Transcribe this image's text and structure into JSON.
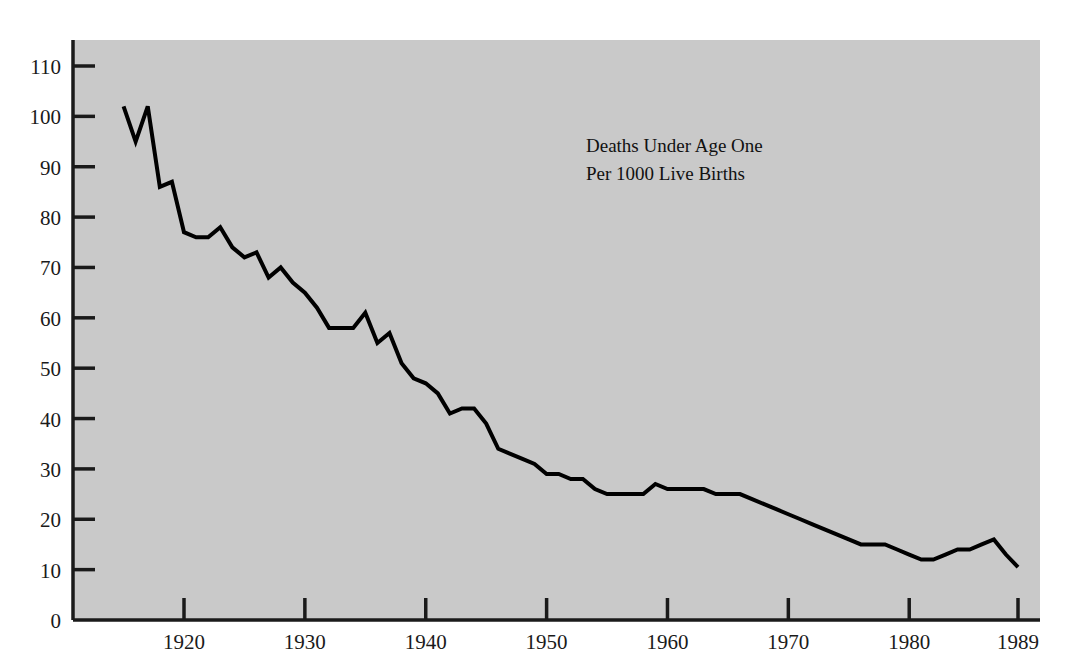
{
  "chart_data": {
    "type": "line",
    "title": "",
    "annotation": [
      "Deaths Under Age One",
      "Per 1000 Live Births"
    ],
    "xlabel": "",
    "ylabel": "",
    "xlim": [
      1915,
      1989
    ],
    "ylim": [
      0,
      115
    ],
    "grid": false,
    "legend": "none",
    "plot_background": "#c9c9c9",
    "line_color": "#000000",
    "axis_color": "#1a1a1a",
    "y_ticks": [
      0,
      10,
      20,
      30,
      40,
      50,
      60,
      70,
      80,
      90,
      100,
      110
    ],
    "y_tick_labels": [
      "0",
      "10",
      "20",
      "30",
      "40",
      "50",
      "60",
      "70",
      "80",
      "90",
      "100",
      "110"
    ],
    "x_ticks": [
      1920,
      1930,
      1940,
      1950,
      1960,
      1970,
      1980,
      1989
    ],
    "x_tick_labels": [
      "1920",
      "1930",
      "1940",
      "1950",
      "1960",
      "1970",
      "1980",
      "1989"
    ],
    "series": [
      {
        "name": "Infant mortality rate",
        "x": [
          1915,
          1916,
          1917,
          1918,
          1919,
          1920,
          1921,
          1922,
          1923,
          1924,
          1925,
          1926,
          1927,
          1928,
          1929,
          1930,
          1931,
          1932,
          1933,
          1934,
          1935,
          1936,
          1937,
          1938,
          1939,
          1940,
          1941,
          1942,
          1943,
          1944,
          1945,
          1946,
          1947,
          1948,
          1949,
          1950,
          1951,
          1952,
          1953,
          1954,
          1955,
          1956,
          1957,
          1958,
          1959,
          1960,
          1961,
          1962,
          1963,
          1964,
          1965,
          1966,
          1967,
          1968,
          1969,
          1970,
          1971,
          1972,
          1973,
          1974,
          1975,
          1976,
          1977,
          1978,
          1979,
          1980,
          1981,
          1982,
          1983,
          1984,
          1985,
          1986,
          1987,
          1988,
          1989
        ],
        "y": [
          102,
          95,
          102,
          86,
          87,
          77,
          76,
          76,
          78,
          74,
          72,
          73,
          68,
          70,
          67,
          65,
          62,
          58,
          58,
          58,
          61,
          55,
          57,
          51,
          48,
          47,
          45,
          41,
          42,
          42,
          39,
          34,
          33,
          32,
          31,
          29,
          29,
          28,
          28,
          26,
          25,
          25,
          25,
          25,
          27,
          26,
          26,
          26,
          26,
          25,
          25,
          25,
          24,
          23,
          22,
          21,
          20,
          19,
          18,
          17,
          16,
          15,
          15,
          15,
          14,
          13,
          12,
          12,
          13,
          14,
          14,
          15,
          16,
          13,
          10.5
        ],
        "style": "solid",
        "color": "#000000",
        "width": 4
      }
    ],
    "source_note": "",
    "first_value": 102,
    "last_value": 10.5,
    "peak_value": 102,
    "min_value": 10.5
  },
  "figure": {
    "background": "#ffffff",
    "panel_background": "#c9c9c9"
  }
}
